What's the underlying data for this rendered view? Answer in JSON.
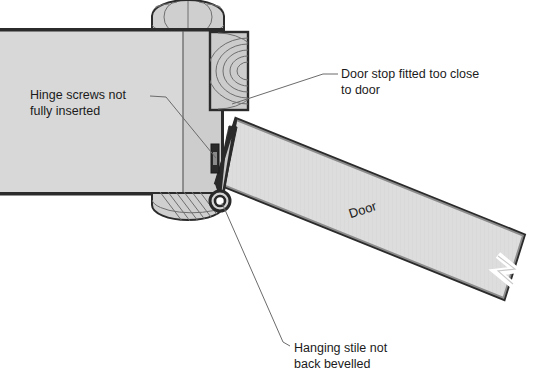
{
  "figure": {
    "type": "technical-cross-section-diagram",
    "background_color": "#ffffff"
  },
  "colors": {
    "panel_fill": "#d7d7d7",
    "panel_fill_light": "#e2e2e2",
    "door_fill": "#dcdcdc",
    "outline": "#2b2b2b",
    "grain_line": "#6e6e6e",
    "leader_line": "#6b6b6b",
    "text": "#1b1b1b",
    "hinge_dark": "#2a2a2a"
  },
  "annotations": [
    {
      "id": "hinge-screws",
      "lines": [
        "Hinge screws not",
        "fully inserted"
      ],
      "text_x": 30,
      "text_y": 99,
      "leader": "M 150,96 L 166,97 L 216,158"
    },
    {
      "id": "door-stop",
      "lines": [
        "Door stop fitted too close",
        "to door"
      ],
      "text_x": 341,
      "text_y": 78,
      "leader": "M 338,74 L 323,74 L 232,104"
    },
    {
      "id": "hanging-stile",
      "lines": [
        "Hanging stile not",
        "back bevelled"
      ],
      "text_x": 294,
      "text_y": 352,
      "leader": "M 290,346 L 283,342 L 222,203"
    }
  ],
  "part_labels": [
    {
      "id": "door",
      "text": "Door",
      "x": 364,
      "y": 214,
      "rotation": -18
    }
  ],
  "parts": {
    "frame_head": "frame-section",
    "door_stop": "door-stop-block",
    "hinge_knuckle": "hinge-knuckle",
    "hinge_leaf": "hinge-leaf",
    "door_leaf": "door-leaf",
    "stile_wedge": "hanging-stile-wedge",
    "break_mark": "break-line-mark"
  }
}
